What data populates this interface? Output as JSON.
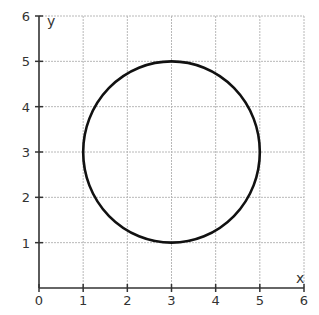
{
  "chart_data": {
    "type": "line",
    "title": "",
    "xlabel": "x",
    "ylabel": "y",
    "xlim": [
      0,
      6
    ],
    "ylim": [
      0,
      6
    ],
    "grid": true,
    "x_ticks": [
      "0",
      "1",
      "2",
      "3",
      "4",
      "5",
      "6"
    ],
    "y_ticks": [
      "1",
      "2",
      "3",
      "4",
      "5",
      "6"
    ],
    "series": [
      {
        "name": "circle",
        "shape": "circle",
        "center": [
          3,
          3
        ],
        "radius": 2,
        "equation": "(x-3)^2 + (y-3)^2 = 4",
        "color": "#111111"
      }
    ]
  },
  "colors": {
    "grid": "#b8b8b8",
    "axis": "#333333",
    "curve": "#111111"
  }
}
